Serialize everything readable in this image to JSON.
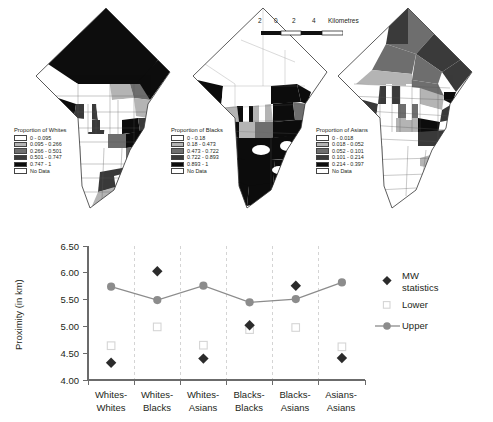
{
  "scalebar": {
    "ticks": [
      "2",
      "0",
      "2",
      "4"
    ],
    "unit": "Kilometres"
  },
  "maps": [
    {
      "id": "whites",
      "legend_title": "Proportion of Whites",
      "classes": [
        {
          "label": "0 - 0.095",
          "color": "#ffffff"
        },
        {
          "label": "0.095 - 0.266",
          "color": "#b4b4b4"
        },
        {
          "label": "0.266 - 0.501",
          "color": "#6e6e6e"
        },
        {
          "label": "0.501 - 0.747",
          "color": "#3a3a3a"
        },
        {
          "label": "0.747 - 1",
          "color": "#0d0d0d"
        },
        {
          "label": "No Data",
          "color": "#ffffff"
        }
      ]
    },
    {
      "id": "blacks",
      "legend_title": "Proportion of Blacks",
      "classes": [
        {
          "label": "0 - 0.18",
          "color": "#ffffff"
        },
        {
          "label": "0.18 - 0.473",
          "color": "#b4b4b4"
        },
        {
          "label": "0.473 - 0.722",
          "color": "#6e6e6e"
        },
        {
          "label": "0.722 - 0.893",
          "color": "#3a3a3a"
        },
        {
          "label": "0.893 - 1",
          "color": "#0d0d0d"
        },
        {
          "label": "No Data",
          "color": "#ffffff"
        }
      ]
    },
    {
      "id": "asians",
      "legend_title": "Proportion of Asians",
      "classes": [
        {
          "label": "0 - 0.018",
          "color": "#ffffff"
        },
        {
          "label": "0.018 - 0.052",
          "color": "#b4b4b4"
        },
        {
          "label": "0.052 - 0.101",
          "color": "#6e6e6e"
        },
        {
          "label": "0.101 - 0.214",
          "color": "#3a3a3a"
        },
        {
          "label": "0.214 - 0.397",
          "color": "#0d0d0d"
        },
        {
          "label": "No Data",
          "color": "#ffffff"
        }
      ]
    }
  ],
  "chart_data": {
    "type": "scatter",
    "title": "",
    "xlabel": "",
    "ylabel": "Proximity (in km)",
    "categories": [
      "Whites-Whites",
      "Whites-Blacks",
      "Whites-Asians",
      "Blacks-Blacks",
      "Blacks-Asians",
      "Asians-Asians"
    ],
    "ylim": [
      4.0,
      6.5
    ],
    "yticks": [
      4.0,
      4.5,
      5.0,
      5.5,
      6.0,
      6.5
    ],
    "ytick_labels": [
      "4.00",
      "4.50",
      "5.00",
      "5.50",
      "6.00",
      "6.50"
    ],
    "grid": "vertical-dashed",
    "legend_position": "right",
    "series": [
      {
        "name": "MW statistics",
        "marker": "diamond",
        "color": "#2b2b2b",
        "line": false,
        "values": [
          4.32,
          6.03,
          4.4,
          5.02,
          5.76,
          4.41
        ]
      },
      {
        "name": "Lower",
        "marker": "open-square",
        "color": "#d8d8d8",
        "line": false,
        "values": [
          4.64,
          4.99,
          4.65,
          4.94,
          4.98,
          4.62
        ]
      },
      {
        "name": "Upper",
        "marker": "circle",
        "color": "#8c8c8c",
        "line": true,
        "values": [
          5.74,
          5.49,
          5.76,
          5.45,
          5.51,
          5.82
        ]
      }
    ]
  }
}
